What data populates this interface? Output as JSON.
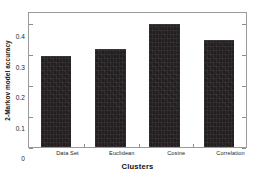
{
  "chart_data": {
    "type": "bar",
    "title": "",
    "xlabel": "Clusters",
    "ylabel": "2-Markov model accuracy",
    "categories": [
      "Data Set",
      "Euclidean",
      "Cosine",
      "Correlation"
    ],
    "values": [
      0.3,
      0.322,
      0.405,
      0.352
    ],
    "ylim": [
      0,
      0.44
    ],
    "xlim": [
      0,
      4
    ],
    "yticks": [
      0,
      0.1,
      0.2,
      0.3,
      0.4
    ],
    "ytick_labels": [
      "0",
      "0.1",
      "0.2",
      "0.3",
      "0.4"
    ],
    "grid": false,
    "legend": null,
    "bar_color": "#231f20",
    "axis_color": "#9a9a9a",
    "background": "#ffffff"
  }
}
